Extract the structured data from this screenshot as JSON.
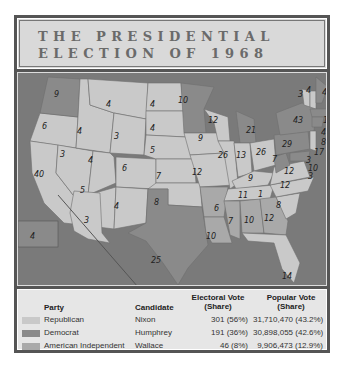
{
  "title": {
    "line1": "THE PRESIDENTIAL",
    "line2": "ELECTION OF 1968"
  },
  "colors": {
    "republican": "#c9c9c9",
    "democrat": "#8a8a8a",
    "american_independent": "#a9a9a9",
    "water": "#7a7a7a",
    "border": "#555555"
  },
  "map": {
    "states": [
      {
        "state": "WA",
        "ev": "9",
        "party": "democrat"
      },
      {
        "state": "OR",
        "ev": "6",
        "party": "republican"
      },
      {
        "state": "CA",
        "ev": "40",
        "party": "republican"
      },
      {
        "state": "NV",
        "ev": "3",
        "party": "republican"
      },
      {
        "state": "ID",
        "ev": "4",
        "party": "republican"
      },
      {
        "state": "MT",
        "ev": "4",
        "party": "republican"
      },
      {
        "state": "WY",
        "ev": "3",
        "party": "republican"
      },
      {
        "state": "UT",
        "ev": "4",
        "party": "republican"
      },
      {
        "state": "AZ",
        "ev": "5",
        "party": "republican"
      },
      {
        "state": "CO",
        "ev": "6",
        "party": "republican"
      },
      {
        "state": "NM",
        "ev": "4",
        "party": "republican"
      },
      {
        "state": "ND",
        "ev": "4",
        "party": "republican"
      },
      {
        "state": "SD",
        "ev": "4",
        "party": "republican"
      },
      {
        "state": "NE",
        "ev": "5",
        "party": "republican"
      },
      {
        "state": "KS",
        "ev": "7",
        "party": "republican"
      },
      {
        "state": "OK",
        "ev": "8",
        "party": "republican"
      },
      {
        "state": "TX",
        "ev": "25",
        "party": "democrat"
      },
      {
        "state": "MN",
        "ev": "10",
        "party": "democrat"
      },
      {
        "state": "IA",
        "ev": "9",
        "party": "republican"
      },
      {
        "state": "MO",
        "ev": "12",
        "party": "republican"
      },
      {
        "state": "AR",
        "ev": "6",
        "party": "american_independent"
      },
      {
        "state": "LA",
        "ev": "10",
        "party": "american_independent"
      },
      {
        "state": "WI",
        "ev": "12",
        "party": "republican"
      },
      {
        "state": "IL",
        "ev": "26",
        "party": "republican"
      },
      {
        "state": "MI",
        "ev": "21",
        "party": "democrat"
      },
      {
        "state": "IN",
        "ev": "13",
        "party": "republican"
      },
      {
        "state": "OH",
        "ev": "26",
        "party": "republican"
      },
      {
        "state": "KY",
        "ev": "9",
        "party": "republican"
      },
      {
        "state": "TN",
        "ev": "11",
        "party": "republican"
      },
      {
        "state": "MS",
        "ev": "7",
        "party": "american_independent"
      },
      {
        "state": "AL",
        "ev": "10",
        "party": "american_independent"
      },
      {
        "state": "GA",
        "ev": "12",
        "party": "american_independent"
      },
      {
        "state": "FL",
        "ev": "14",
        "party": "republican"
      },
      {
        "state": "SC",
        "ev": "8",
        "party": "republican"
      },
      {
        "state": "NC",
        "ev": "12",
        "party": "republican"
      },
      {
        "state": "NC_faithless",
        "ev": "1",
        "party": "american_independent"
      },
      {
        "state": "VA",
        "ev": "12",
        "party": "republican"
      },
      {
        "state": "WV",
        "ev": "7",
        "party": "democrat"
      },
      {
        "state": "PA",
        "ev": "29",
        "party": "democrat"
      },
      {
        "state": "NY",
        "ev": "43",
        "party": "democrat"
      },
      {
        "state": "VT",
        "ev": "3",
        "party": "republican"
      },
      {
        "state": "NH",
        "ev": "4",
        "party": "republican"
      },
      {
        "state": "ME",
        "ev": "4",
        "party": "democrat"
      },
      {
        "state": "MA",
        "ev": "14",
        "party": "democrat"
      },
      {
        "state": "RI",
        "ev": "4",
        "party": "democrat"
      },
      {
        "state": "CT",
        "ev": "8",
        "party": "democrat"
      },
      {
        "state": "NJ",
        "ev": "17",
        "party": "republican"
      },
      {
        "state": "DE",
        "ev": "3",
        "party": "republican"
      },
      {
        "state": "MD",
        "ev": "10",
        "party": "democrat"
      },
      {
        "state": "DC",
        "ev": "3",
        "party": "democrat"
      },
      {
        "state": "AK",
        "ev": "3",
        "party": "republican"
      },
      {
        "state": "HI",
        "ev": "4",
        "party": "democrat"
      }
    ]
  },
  "legend": {
    "headers": {
      "party": "Party",
      "candidate": "Candidate",
      "electoral_1": "Electoral Vote",
      "electoral_2": "(Share)",
      "popular_1": "Popular Vote",
      "popular_2": "(Share)"
    },
    "rows": [
      {
        "party": "Republican",
        "candidate": "Nixon",
        "electoral": "301 (56%)",
        "popular": "31,710,470 (43.2%)"
      },
      {
        "party": "Democrat",
        "candidate": "Humphrey",
        "electoral": "191 (36%)",
        "popular": "30,898,055 (42.6%)"
      },
      {
        "party": "American Independent",
        "candidate": "Wallace",
        "electoral": "46 (8%)",
        "popular": "9,906,473 (12.9%)"
      }
    ]
  }
}
